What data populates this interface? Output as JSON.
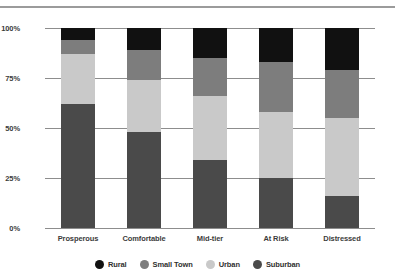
{
  "chart_data": {
    "type": "bar",
    "stacked": true,
    "title": "",
    "xlabel": "",
    "ylabel": "",
    "categories": [
      "Prosperous",
      "Comfortable",
      "Mid-tier",
      "At Risk",
      "Distressed"
    ],
    "series": [
      {
        "name": "Suburban",
        "color": "#4a4a4a",
        "values": [
          62,
          48,
          34,
          25,
          16
        ]
      },
      {
        "name": "Urban",
        "color": "#c9c9c9",
        "values": [
          25,
          26,
          32,
          33,
          39
        ]
      },
      {
        "name": "Small Town",
        "color": "#7d7d7d",
        "values": [
          7,
          15,
          19,
          25,
          24
        ]
      },
      {
        "name": "Rural",
        "color": "#111111",
        "values": [
          6,
          11,
          15,
          17,
          21
        ]
      }
    ],
    "stack_order_bottom_to_top": [
      "Suburban",
      "Urban",
      "Small Town",
      "Rural"
    ],
    "ylim": [
      0,
      100
    ],
    "yticks": [
      0,
      25,
      50,
      75,
      100
    ],
    "ytick_labels": [
      "0%",
      "25%",
      "50%",
      "75%",
      "100%"
    ],
    "grid": true,
    "legend_position": "bottom",
    "legend": [
      {
        "label": "Rural",
        "color": "#111111"
      },
      {
        "label": "Small Town",
        "color": "#7d7d7d"
      },
      {
        "label": "Urban",
        "color": "#c9c9c9"
      },
      {
        "label": "Suburban",
        "color": "#4a4a4a"
      }
    ]
  }
}
